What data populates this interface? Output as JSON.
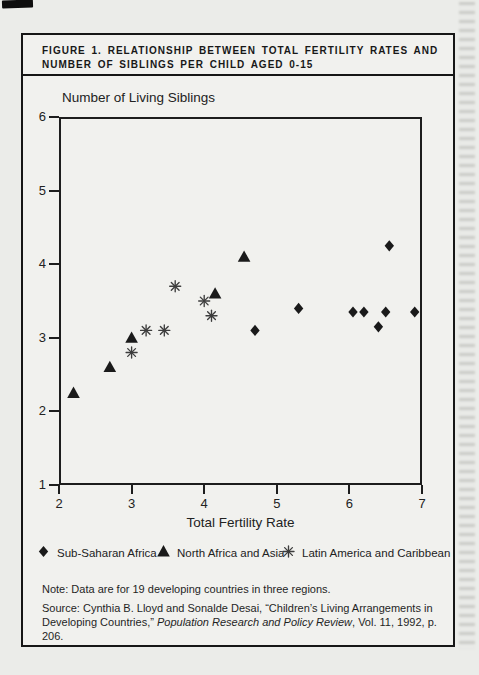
{
  "figure": {
    "title_line1": "FIGURE 1. RELATIONSHIP BETWEEN TOTAL FERTILITY RATES AND",
    "title_line2": "NUMBER OF SIBLINGS PER CHILD AGED 0-15",
    "note": "Note: Data are for 19 developing countries in three regions.",
    "source_prefix": "Source: Cynthia B. Lloyd and Sonalde Desai, “Children’s Living Arrangements in Developing Countries,” ",
    "source_italic": "Population Research and Policy Review",
    "source_suffix": ", Vol. 11, 1992, p. 206."
  },
  "chart_data": {
    "type": "scatter",
    "title": "Relationship between total fertility rates and number of siblings per child aged 0-15",
    "xlabel": "Total Fertility Rate",
    "ylabel": "Number of Living Siblings",
    "xlim": [
      2,
      7
    ],
    "ylim": [
      1,
      6
    ],
    "xticks": [
      2,
      3,
      4,
      5,
      6,
      7
    ],
    "yticks": [
      1,
      2,
      3,
      4,
      5,
      6
    ],
    "grid": false,
    "legend_position": "bottom",
    "ink_color": "#1a1a1a",
    "asterisk_color": "#3d3d3d",
    "series": [
      {
        "name": "Sub-Saharan Africa",
        "marker": "diamond",
        "points": [
          [
            4.7,
            3.1
          ],
          [
            5.3,
            3.4
          ],
          [
            6.05,
            3.35
          ],
          [
            6.2,
            3.35
          ],
          [
            6.4,
            3.15
          ],
          [
            6.5,
            3.35
          ],
          [
            6.55,
            4.25
          ],
          [
            6.9,
            3.35
          ]
        ]
      },
      {
        "name": "North Africa and Asia",
        "marker": "triangle",
        "points": [
          [
            2.2,
            2.25
          ],
          [
            2.7,
            2.6
          ],
          [
            3.0,
            3.0
          ],
          [
            4.15,
            3.6
          ],
          [
            4.55,
            4.1
          ]
        ]
      },
      {
        "name": "Latin America and Caribbean",
        "marker": "asterisk",
        "points": [
          [
            3.0,
            2.8
          ],
          [
            3.2,
            3.1
          ],
          [
            3.45,
            3.1
          ],
          [
            3.6,
            3.7
          ],
          [
            4.0,
            3.5
          ],
          [
            4.1,
            3.3
          ]
        ]
      }
    ]
  }
}
